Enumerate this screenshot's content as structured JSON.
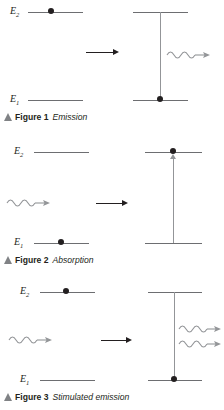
{
  "figures": [
    {
      "id": "figure-1",
      "caption_number": "Figure 1",
      "caption_title": "Emission",
      "levels": {
        "upper_label": "E",
        "upper_sub": "2",
        "lower_label": "E",
        "lower_sub": "1"
      },
      "process_arrow": "right-arrow",
      "left_panel": {
        "electron_on": "upper",
        "photon": "none"
      },
      "right_panel": {
        "electron_on": "lower",
        "transition_direction": "down",
        "photons_out": 1
      }
    },
    {
      "id": "figure-2",
      "caption_number": "Figure 2",
      "caption_title": "Absorption",
      "levels": {
        "upper_label": "E",
        "upper_sub": "2",
        "lower_label": "E",
        "lower_sub": "1"
      },
      "process_arrow": "right-arrow",
      "left_panel": {
        "electron_on": "lower",
        "photon": "incoming"
      },
      "right_panel": {
        "electron_on": "upper",
        "transition_direction": "up",
        "photons_out": 0
      }
    },
    {
      "id": "figure-3",
      "caption_number": "Figure 3",
      "caption_title": "Stimulated emission",
      "levels": {
        "upper_label": "E",
        "upper_sub": "2",
        "lower_label": "E",
        "lower_sub": "1"
      },
      "process_arrow": "right-arrow",
      "left_panel": {
        "electron_on": "upper",
        "photon": "incoming"
      },
      "right_panel": {
        "electron_on": "lower",
        "transition_direction": "down",
        "photons_out": 2
      }
    }
  ],
  "colors": {
    "level_line": "#6d6e71",
    "electron": "#231f20",
    "transition_line": "#939598",
    "process_arrow": "#231f20",
    "photon": "#939598",
    "caption_triangle": "#808285",
    "text": "#231f20",
    "background": "#ffffff"
  },
  "icons": {
    "photon": "wavy-photon-arrow-icon",
    "process": "right-arrow-icon",
    "caption_marker": "caption-triangle-icon",
    "electron": "electron-dot-icon"
  }
}
